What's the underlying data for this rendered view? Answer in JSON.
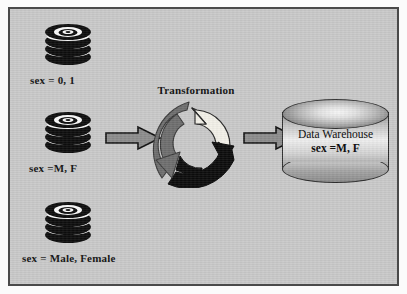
{
  "diagram": {
    "background_color": "#c9c9c9",
    "frame_color": "#4a4a4a",
    "sources": [
      {
        "icon": "database-stack-icon",
        "label": "sex = 0, 1"
      },
      {
        "icon": "database-stack-icon",
        "label": "sex =M, F"
      },
      {
        "icon": "database-stack-icon",
        "label": "sex = Male, Female"
      }
    ],
    "arrows": [
      {
        "name": "arrow-source-to-transformation",
        "direction": "right",
        "fill": "#8c8c8c",
        "stroke": "#111111"
      },
      {
        "name": "arrow-transformation-to-warehouse",
        "direction": "right",
        "fill": "#8c8c8c",
        "stroke": "#111111"
      }
    ],
    "transformation": {
      "label": "Transformation",
      "icon": "recycle-arrows-icon",
      "arrow_colors": {
        "top_light": "#f2f0e8",
        "bottom_dark": "#0c0c0c",
        "left_gray": "#6e6e6e"
      }
    },
    "warehouse": {
      "icon": "cylinder-database-icon",
      "line1": "Data Warehouse",
      "line2": "sex =M, F"
    }
  }
}
